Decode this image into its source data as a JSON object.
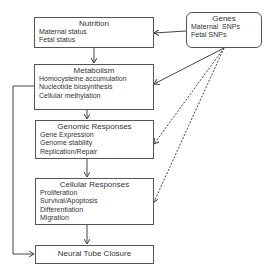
{
  "diagram": {
    "boxes": [
      {
        "id": "nutrition",
        "title": "Nutrition",
        "items": [
          "Maternal status",
          "Fetal status"
        ]
      },
      {
        "id": "metabolism",
        "title": "Metabolism",
        "items": [
          "Homocysteine accumulation",
          "Nucleotide biosynthesis",
          "Cellular methylation"
        ]
      },
      {
        "id": "genomic",
        "title": "Genomic Responses",
        "items": [
          "Gene Expression",
          "Genome stability",
          "Replication/Repair"
        ]
      },
      {
        "id": "cellular",
        "title": "Cellular Responses",
        "items": [
          "Proliferation",
          "Survival/Apoptosis",
          "Differentiation",
          "Migration"
        ]
      },
      {
        "id": "ntc",
        "title": "Neural Tube Closure",
        "items": []
      }
    ],
    "genes": {
      "title": "Genes",
      "items": [
        "Maternal  SNPs",
        "Fetal SNPs"
      ]
    },
    "edges": [
      {
        "from": "nutrition",
        "to": "metabolism",
        "style": "solid"
      },
      {
        "from": "metabolism",
        "to": "genomic",
        "style": "solid"
      },
      {
        "from": "genomic",
        "to": "cellular",
        "style": "solid"
      },
      {
        "from": "cellular",
        "to": "ntc",
        "style": "solid"
      },
      {
        "from": "metabolism",
        "to": "ntc",
        "style": "solid"
      },
      {
        "from": "genes",
        "to": "nutrition",
        "style": "solid"
      },
      {
        "from": "genes",
        "to": "metabolism",
        "style": "solid"
      },
      {
        "from": "genes",
        "to": "genomic",
        "style": "dashed"
      },
      {
        "from": "genes",
        "to": "cellular",
        "style": "dashed"
      }
    ]
  }
}
